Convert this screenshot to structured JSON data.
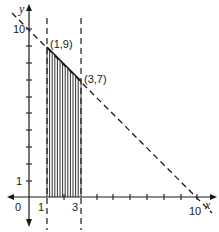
{
  "diagram": {
    "title": "",
    "axes": {
      "x_label": "x",
      "y_label": "y",
      "origin_label": "0",
      "x_tick_labels": [
        {
          "value": 1,
          "text": "1"
        },
        {
          "value": 3,
          "text": "3"
        },
        {
          "value": 10,
          "text": "10"
        }
      ],
      "y_tick_labels": [
        {
          "value": 1,
          "text": "1"
        },
        {
          "value": 10,
          "text": "10"
        }
      ],
      "x_range": [
        0,
        10
      ],
      "y_range": [
        0,
        10
      ]
    },
    "points": [
      {
        "label": "(1,9)",
        "x": 1,
        "y": 9
      },
      {
        "label": "(3,7)",
        "x": 3,
        "y": 7
      }
    ],
    "lines": [
      {
        "name": "x + y = 10",
        "style": "dashed"
      },
      {
        "name": "x = 1",
        "style": "dashed"
      },
      {
        "name": "x = 3",
        "style": "dashed"
      }
    ],
    "shaded_region": {
      "description": "area under x + y = 10 between x = 1 and x = 3",
      "style": "vertical hatching"
    },
    "colors": {
      "ink": "#1a1a1a",
      "background": "#ffffff"
    }
  }
}
